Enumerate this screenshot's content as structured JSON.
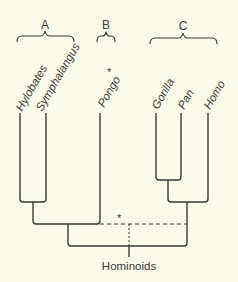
{
  "diagram": {
    "type": "cladogram",
    "groups": [
      {
        "id": "A",
        "label": "A",
        "members": [
          "Hylobates",
          "Symphalangus"
        ]
      },
      {
        "id": "B",
        "label": "B",
        "members": [
          "Pongo"
        ]
      },
      {
        "id": "C",
        "label": "C",
        "members": [
          "Gorilla",
          "Pan",
          "Homo"
        ]
      }
    ],
    "taxa": [
      {
        "name": "Hylobates",
        "marker": ""
      },
      {
        "name": "Symphalangus",
        "marker": ""
      },
      {
        "name": "Pongo",
        "marker": "*"
      },
      {
        "name": "Gorilla",
        "marker": ""
      },
      {
        "name": "Pan",
        "marker": ""
      },
      {
        "name": "Homo",
        "marker": ""
      }
    ],
    "root_label": "Hominoids",
    "dashed_node_marker": "*",
    "colors": {
      "background": "#fbfbea",
      "line": "#3a3a36"
    }
  }
}
